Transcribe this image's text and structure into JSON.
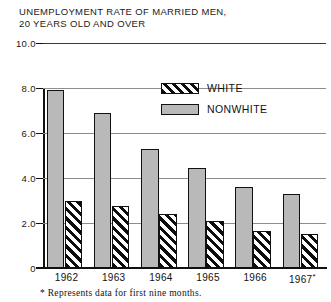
{
  "chart_data": {
    "type": "bar",
    "title": "UNEMPLOYMENT RATE OF MARRIED MEN,\n20 YEARS OLD AND OVER",
    "xlabel": "",
    "ylabel": "",
    "ylim": [
      0,
      10.0
    ],
    "grid": true,
    "legend_position": "upper-center",
    "categories": [
      "1962",
      "1963",
      "1964",
      "1965",
      "1966",
      "1967*"
    ],
    "ytick_labels": [
      "0",
      "2.0",
      "4.0",
      "6.0",
      "8.0",
      "10.0"
    ],
    "ytick_values": [
      0,
      2.0,
      4.0,
      6.0,
      8.0,
      10.0
    ],
    "series": [
      {
        "name": "NONWHITE",
        "color": "#b9b9b9",
        "fill": "solid-gray",
        "values": [
          7.9,
          6.9,
          5.3,
          4.45,
          3.6,
          3.3
        ]
      },
      {
        "name": "WHITE",
        "color": "#0d0d0d",
        "fill": "diagonal-hatch",
        "values": [
          3.0,
          2.75,
          2.4,
          2.1,
          1.65,
          1.5
        ]
      }
    ],
    "annotations": [
      "* Represents data for first nine months."
    ]
  },
  "legend": {
    "entries": [
      {
        "label": "WHITE",
        "fill": "diagonal-hatch"
      },
      {
        "label": "NONWHITE",
        "fill": "solid-gray"
      }
    ]
  },
  "footnote": {
    "text": "* Represents data for first nine months."
  }
}
